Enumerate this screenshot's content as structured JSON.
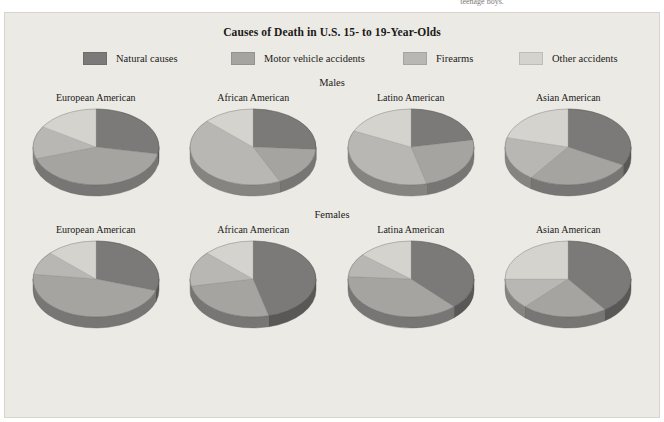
{
  "page": {
    "cutoff_text": "teenage boys.",
    "background_color": "#eceae4"
  },
  "figure": {
    "title": "Causes of Death in U.S. 15- to 19-Year-Olds"
  },
  "legend": {
    "items": [
      {
        "label": "Natural causes",
        "key": "natural",
        "color": "#7c7a78"
      },
      {
        "label": "Motor vehicle accidents",
        "key": "motor",
        "color": "#a6a4a1"
      },
      {
        "label": "Firearms",
        "key": "firearms",
        "color": "#b9b7b3"
      },
      {
        "label": "Other accidents",
        "key": "other",
        "color": "#d5d3ce"
      }
    ]
  },
  "groups": [
    {
      "label": "Males",
      "key": "males"
    },
    {
      "label": "Females",
      "key": "females"
    }
  ],
  "chart_data": {
    "type": "pie",
    "title": "Causes of Death in U.S. 15- to 19-Year-Olds",
    "xlabel": "",
    "ylabel": "",
    "unit": "percent",
    "legend_position": "top",
    "grid": false,
    "slice_labels": [
      "Natural causes",
      "Motor vehicle accidents",
      "Firearms",
      "Other accidents"
    ],
    "slice_colors": [
      "#7c7a78",
      "#a6a4a1",
      "#b9b7b3",
      "#d5d3ce"
    ],
    "panels": [
      {
        "group": "Males",
        "category": "European American",
        "title": "European American",
        "categories": [
          "Natural causes",
          "Motor vehicle accidents",
          "Firearms",
          "Other accidents"
        ],
        "values": [
          28,
          42,
          14,
          16
        ]
      },
      {
        "group": "Males",
        "category": "African American",
        "title": "African American",
        "categories": [
          "Natural causes",
          "Motor vehicle accidents",
          "Firearms",
          "Other accidents"
        ],
        "values": [
          26,
          17,
          44,
          13
        ]
      },
      {
        "group": "Males",
        "category": "Latino American",
        "title": "Latino American",
        "categories": [
          "Natural causes",
          "Motor vehicle accidents",
          "Firearms",
          "Other accidents"
        ],
        "values": [
          22,
          24,
          36,
          18
        ]
      },
      {
        "group": "Males",
        "category": "Asian American",
        "title": "Asian American",
        "categories": [
          "Natural causes",
          "Motor vehicle accidents",
          "Firearms",
          "Other accidents"
        ],
        "values": [
          33,
          27,
          19,
          21
        ]
      },
      {
        "group": "Females",
        "category": "European American",
        "title": "European American",
        "categories": [
          "Natural causes",
          "Motor vehicle accidents",
          "Firearms",
          "Other accidents"
        ],
        "values": [
          30,
          47,
          10,
          13
        ]
      },
      {
        "group": "Females",
        "category": "African American",
        "title": "African American",
        "categories": [
          "Natural causes",
          "Motor vehicle accidents",
          "Firearms",
          "Other accidents"
        ],
        "values": [
          46,
          26,
          15,
          13
        ]
      },
      {
        "group": "Females",
        "category": "Latina American",
        "title": "Latina American",
        "categories": [
          "Natural causes",
          "Motor vehicle accidents",
          "Firearms",
          "Other accidents"
        ],
        "values": [
          38,
          38,
          10,
          14
        ]
      },
      {
        "group": "Females",
        "category": "Asian American",
        "title": "Asian American",
        "categories": [
          "Natural causes",
          "Motor vehicle accidents",
          "Firearms",
          "Other accidents"
        ],
        "values": [
          40,
          22,
          13,
          25
        ]
      }
    ]
  }
}
